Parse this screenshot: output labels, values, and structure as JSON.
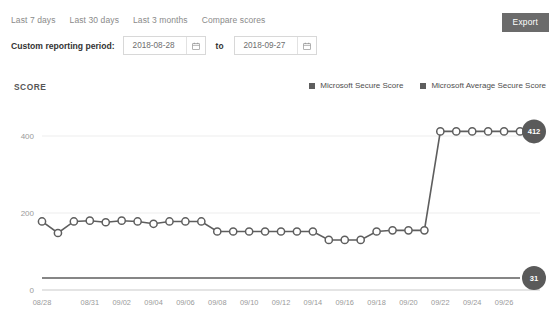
{
  "toolbar": {
    "tabs": [
      {
        "label": "Last 7 days"
      },
      {
        "label": "Last 30 days"
      },
      {
        "label": "Last 3 months"
      },
      {
        "label": "Compare scores"
      }
    ],
    "period_label": "Custom reporting period:",
    "start_date": "2018-08-28",
    "end_date": "2018-09-27",
    "to_word": "to",
    "start_calendar_icon": "calendar-icon",
    "end_calendar_icon": "calendar-icon",
    "export_label": "Export"
  },
  "chart_header": {
    "title": "SCORE",
    "legend": [
      {
        "label": "Microsoft Secure Score",
        "color": "#5e5e5e",
        "marker": "square"
      },
      {
        "label": "Microsoft Average Secure Score",
        "color": "#5e5e5e",
        "marker": "square"
      }
    ]
  },
  "chart_data": {
    "type": "line",
    "title": "SCORE",
    "xlabel": "",
    "ylabel": "",
    "ylim": [
      0,
      440
    ],
    "yticks": [
      0,
      200,
      400
    ],
    "ytick_labels": [
      "0",
      "200",
      "400"
    ],
    "grid": "horizontal",
    "legend_position": "top-right",
    "x": [
      "08/28",
      "08/29",
      "08/30",
      "08/31",
      "09/01",
      "09/02",
      "09/03",
      "09/04",
      "09/05",
      "09/06",
      "09/07",
      "09/08",
      "09/09",
      "09/10",
      "09/11",
      "09/12",
      "09/13",
      "09/14",
      "09/15",
      "09/16",
      "09/17",
      "09/18",
      "09/19",
      "09/20",
      "09/21",
      "09/22",
      "09/23",
      "09/24",
      "09/25",
      "09/26",
      "09/27"
    ],
    "xtick_labels": [
      "08/28",
      "08/31",
      "09/02",
      "09/04",
      "09/06",
      "09/08",
      "09/10",
      "09/12",
      "09/14",
      "09/16",
      "09/18",
      "09/20",
      "09/22",
      "09/24",
      "09/26"
    ],
    "series": [
      {
        "name": "Microsoft Secure Score",
        "color": "#5e5e5e",
        "marker": "open-circle",
        "end_label": "412",
        "values": [
          178,
          148,
          178,
          180,
          176,
          180,
          178,
          172,
          178,
          178,
          178,
          152,
          152,
          152,
          152,
          152,
          152,
          152,
          130,
          130,
          130,
          152,
          155,
          155,
          155,
          412,
          412,
          412,
          412,
          412,
          412
        ]
      },
      {
        "name": "Microsoft Average Secure Score",
        "color": "#5e5e5e",
        "marker": "none",
        "end_label": "31",
        "values": [
          31,
          31,
          31,
          31,
          31,
          31,
          31,
          31,
          31,
          31,
          31,
          31,
          31,
          31,
          31,
          31,
          31,
          31,
          31,
          31,
          31,
          31,
          31,
          31,
          31,
          31,
          31,
          31,
          31,
          31,
          31
        ]
      }
    ]
  }
}
